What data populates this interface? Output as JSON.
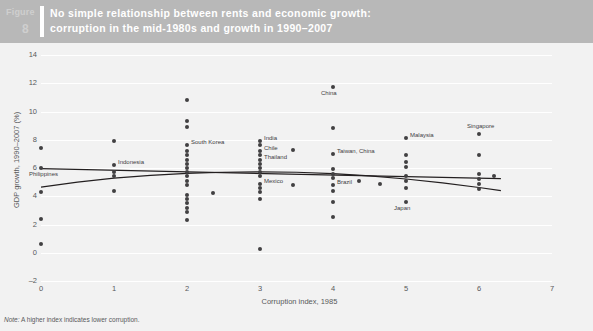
{
  "header": {
    "figure_word": "Figure",
    "figure_number": "8",
    "title_line1": "No simple relationship between rents and economic growth:",
    "title_line2": "corruption in the mid-1980s and growth in 1990–2007",
    "band_color": "#b8b8b8",
    "text_color": "#ffffff"
  },
  "note": {
    "prefix": "Note:",
    "text": "A higher index indicates lower corruption."
  },
  "chart_data": {
    "type": "scatter",
    "title": "No simple relationship between rents and economic growth: corruption in the mid-1980s and growth in 1990–2007",
    "xlabel": "Corruption index, 1985",
    "ylabel": "GDP growth, 1990–2007 (%)",
    "xlim": [
      0,
      7
    ],
    "ylim": [
      -2,
      14
    ],
    "xticks": [
      0,
      1,
      2,
      3,
      4,
      5,
      6,
      7
    ],
    "yticks": [
      -2,
      0,
      2,
      4,
      6,
      8,
      10,
      12,
      14
    ],
    "grid": "horizontal",
    "legend": "none",
    "marker_color": "#414042",
    "trend_color": "#231f20",
    "points": [
      {
        "x": 0.0,
        "y": 7.4,
        "label": ""
      },
      {
        "x": 0.0,
        "y": 6.0,
        "label": "Philippines",
        "label_pos": "below"
      },
      {
        "x": 0.0,
        "y": 4.3,
        "label": ""
      },
      {
        "x": 0.0,
        "y": 2.4,
        "label": ""
      },
      {
        "x": 0.0,
        "y": 0.6,
        "label": ""
      },
      {
        "x": 1.0,
        "y": 7.9,
        "label": ""
      },
      {
        "x": 1.0,
        "y": 6.2,
        "label": "Indonesia",
        "label_pos": "right"
      },
      {
        "x": 1.0,
        "y": 5.7,
        "label": ""
      },
      {
        "x": 1.0,
        "y": 5.4,
        "label": ""
      },
      {
        "x": 1.0,
        "y": 4.4,
        "label": ""
      },
      {
        "x": 2.0,
        "y": 10.8,
        "label": ""
      },
      {
        "x": 2.0,
        "y": 9.3,
        "label": ""
      },
      {
        "x": 2.0,
        "y": 8.9,
        "label": ""
      },
      {
        "x": 2.0,
        "y": 7.6,
        "label": "South Korea",
        "label_pos": "right"
      },
      {
        "x": 2.0,
        "y": 7.2,
        "label": ""
      },
      {
        "x": 2.0,
        "y": 6.9,
        "label": ""
      },
      {
        "x": 2.0,
        "y": 6.6,
        "label": ""
      },
      {
        "x": 2.0,
        "y": 6.3,
        "label": ""
      },
      {
        "x": 2.0,
        "y": 6.0,
        "label": ""
      },
      {
        "x": 2.0,
        "y": 5.7,
        "label": ""
      },
      {
        "x": 2.0,
        "y": 5.4,
        "label": ""
      },
      {
        "x": 2.0,
        "y": 5.1,
        "label": ""
      },
      {
        "x": 2.0,
        "y": 4.8,
        "label": ""
      },
      {
        "x": 2.0,
        "y": 4.1,
        "label": ""
      },
      {
        "x": 2.0,
        "y": 3.8,
        "label": ""
      },
      {
        "x": 2.0,
        "y": 3.5,
        "label": ""
      },
      {
        "x": 2.0,
        "y": 3.2,
        "label": ""
      },
      {
        "x": 2.0,
        "y": 2.9,
        "label": ""
      },
      {
        "x": 2.0,
        "y": 2.3,
        "label": ""
      },
      {
        "x": 2.35,
        "y": 4.2,
        "label": ""
      },
      {
        "x": 3.0,
        "y": 7.9,
        "label": "India",
        "label_pos": "right"
      },
      {
        "x": 3.0,
        "y": 7.6,
        "label": ""
      },
      {
        "x": 3.0,
        "y": 7.2,
        "label": "Chile",
        "label_pos": "right"
      },
      {
        "x": 3.0,
        "y": 6.9,
        "label": ""
      },
      {
        "x": 3.0,
        "y": 6.6,
        "label": "Thailand",
        "label_pos": "right"
      },
      {
        "x": 3.0,
        "y": 6.3,
        "label": ""
      },
      {
        "x": 3.0,
        "y": 6.0,
        "label": ""
      },
      {
        "x": 3.0,
        "y": 5.7,
        "label": ""
      },
      {
        "x": 3.0,
        "y": 5.4,
        "label": ""
      },
      {
        "x": 3.0,
        "y": 4.9,
        "label": "Mexico",
        "label_pos": "right"
      },
      {
        "x": 3.0,
        "y": 4.6,
        "label": ""
      },
      {
        "x": 3.0,
        "y": 4.3,
        "label": ""
      },
      {
        "x": 3.0,
        "y": 3.8,
        "label": ""
      },
      {
        "x": 3.0,
        "y": 0.3,
        "label": ""
      },
      {
        "x": 3.45,
        "y": 4.8,
        "label": ""
      },
      {
        "x": 3.45,
        "y": 7.3,
        "label": ""
      },
      {
        "x": 4.0,
        "y": 11.7,
        "label": "China",
        "label_pos": "below"
      },
      {
        "x": 4.0,
        "y": 8.8,
        "label": ""
      },
      {
        "x": 4.0,
        "y": 7.0,
        "label": "Taiwan, China",
        "label_pos": "right"
      },
      {
        "x": 4.0,
        "y": 5.9,
        "label": ""
      },
      {
        "x": 4.0,
        "y": 5.6,
        "label": ""
      },
      {
        "x": 4.0,
        "y": 5.3,
        "label": ""
      },
      {
        "x": 4.0,
        "y": 4.8,
        "label": "Brazil",
        "label_pos": "right"
      },
      {
        "x": 4.0,
        "y": 4.4,
        "label": ""
      },
      {
        "x": 4.0,
        "y": 3.6,
        "label": ""
      },
      {
        "x": 4.0,
        "y": 2.5,
        "label": ""
      },
      {
        "x": 4.35,
        "y": 5.1,
        "label": ""
      },
      {
        "x": 5.0,
        "y": 8.1,
        "label": "Malaysia",
        "label_pos": "right"
      },
      {
        "x": 5.0,
        "y": 6.9,
        "label": ""
      },
      {
        "x": 5.0,
        "y": 6.4,
        "label": ""
      },
      {
        "x": 5.0,
        "y": 6.1,
        "label": ""
      },
      {
        "x": 5.0,
        "y": 5.4,
        "label": ""
      },
      {
        "x": 5.0,
        "y": 5.1,
        "label": ""
      },
      {
        "x": 5.0,
        "y": 4.6,
        "label": ""
      },
      {
        "x": 5.0,
        "y": 3.6,
        "label": "Japan",
        "label_pos": "below"
      },
      {
        "x": 4.65,
        "y": 4.9,
        "label": ""
      },
      {
        "x": 6.0,
        "y": 8.4,
        "label": "Singapore",
        "label_pos": "above"
      },
      {
        "x": 6.0,
        "y": 6.9,
        "label": ""
      },
      {
        "x": 6.0,
        "y": 5.6,
        "label": ""
      },
      {
        "x": 6.0,
        "y": 5.2,
        "label": ""
      },
      {
        "x": 6.0,
        "y": 4.9,
        "label": ""
      },
      {
        "x": 6.0,
        "y": 4.5,
        "label": ""
      },
      {
        "x": 6.2,
        "y": 5.4,
        "label": ""
      }
    ],
    "trend_lines": [
      {
        "name": "quadratic-fit",
        "type": "quadratic",
        "points": [
          {
            "x": 0.0,
            "y": 4.65
          },
          {
            "x": 0.5,
            "y": 5.0
          },
          {
            "x": 1.0,
            "y": 5.28
          },
          {
            "x": 1.5,
            "y": 5.48
          },
          {
            "x": 2.0,
            "y": 5.62
          },
          {
            "x": 2.5,
            "y": 5.7
          },
          {
            "x": 3.0,
            "y": 5.73
          },
          {
            "x": 3.5,
            "y": 5.7
          },
          {
            "x": 4.0,
            "y": 5.6
          },
          {
            "x": 4.5,
            "y": 5.44
          },
          {
            "x": 5.0,
            "y": 5.22
          },
          {
            "x": 5.5,
            "y": 4.95
          },
          {
            "x": 6.0,
            "y": 4.62
          },
          {
            "x": 6.3,
            "y": 4.4
          }
        ]
      },
      {
        "name": "linear-fit",
        "type": "linear",
        "points": [
          {
            "x": 0.0,
            "y": 5.95
          },
          {
            "x": 6.3,
            "y": 5.25
          }
        ]
      }
    ]
  }
}
